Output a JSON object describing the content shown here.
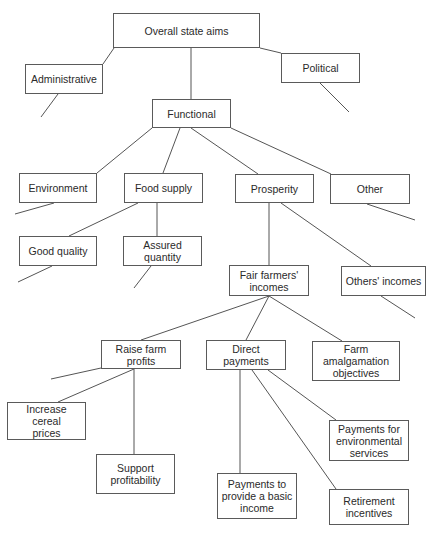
{
  "diagram": {
    "type": "tree",
    "colors": {
      "stroke": "#555555",
      "text": "#2a2a2a",
      "background": "#ffffff"
    },
    "nodes": [
      {
        "id": "overall",
        "label": "Overall state aims",
        "x": 113,
        "y": 13,
        "w": 147,
        "h": 35
      },
      {
        "id": "administrative",
        "label": "Administrative",
        "x": 25,
        "y": 64,
        "w": 78,
        "h": 30
      },
      {
        "id": "political",
        "label": "Political",
        "x": 281,
        "y": 53,
        "w": 79,
        "h": 30
      },
      {
        "id": "functional",
        "label": "Functional",
        "x": 152,
        "y": 99,
        "w": 79,
        "h": 29
      },
      {
        "id": "environment",
        "label": "Environment",
        "x": 19,
        "y": 173,
        "w": 78,
        "h": 30
      },
      {
        "id": "food-supply",
        "label": "Food supply",
        "x": 124,
        "y": 173,
        "w": 79,
        "h": 30
      },
      {
        "id": "prosperity",
        "label": "Prosperity",
        "x": 235,
        "y": 174,
        "w": 79,
        "h": 29
      },
      {
        "id": "other",
        "label": "Other",
        "x": 330,
        "y": 174,
        "w": 80,
        "h": 30
      },
      {
        "id": "good-quality",
        "label": "Good quality",
        "x": 19,
        "y": 236,
        "w": 78,
        "h": 30
      },
      {
        "id": "assured-quantity",
        "label": "Assured quantity",
        "x": 123,
        "y": 236,
        "w": 79,
        "h": 30
      },
      {
        "id": "fair-farmers-incomes",
        "label": "Fair farmers'\nincomes",
        "x": 229,
        "y": 265,
        "w": 80,
        "h": 31
      },
      {
        "id": "others-incomes",
        "label": "Others' incomes",
        "x": 341,
        "y": 266,
        "w": 85,
        "h": 30
      },
      {
        "id": "raise-farm-profits",
        "label": "Raise farm profits",
        "x": 101,
        "y": 340,
        "w": 80,
        "h": 29
      },
      {
        "id": "direct-payments",
        "label": "Direct payments",
        "x": 206,
        "y": 340,
        "w": 80,
        "h": 30
      },
      {
        "id": "farm-amalgamation",
        "label": "Farm amalgamation\nobjectives",
        "x": 312,
        "y": 341,
        "w": 88,
        "h": 40
      },
      {
        "id": "increase-cereal-prices",
        "label": "Increase cereal\nprices",
        "x": 7,
        "y": 402,
        "w": 79,
        "h": 38
      },
      {
        "id": "support-profitability",
        "label": "Support\nprofitability",
        "x": 96,
        "y": 454,
        "w": 79,
        "h": 40
      },
      {
        "id": "payments-env-services",
        "label": "Payments for\nenvironmental\nservices",
        "x": 329,
        "y": 420,
        "w": 80,
        "h": 41
      },
      {
        "id": "payments-basic-income",
        "label": "Payments to\nprovide a basic\nincome",
        "x": 217,
        "y": 473,
        "w": 80,
        "h": 46
      },
      {
        "id": "retirement-incentives",
        "label": "Retirement\nincentives",
        "x": 329,
        "y": 489,
        "w": 80,
        "h": 36
      }
    ],
    "edges": [
      {
        "from": "overall",
        "to": "administrative",
        "x1": 114,
        "y1": 48,
        "x2": 103,
        "y2": 64
      },
      {
        "from": "overall",
        "to": "political",
        "x1": 260,
        "y1": 48,
        "x2": 281,
        "y2": 53
      },
      {
        "from": "overall",
        "to": "functional",
        "x1": 191,
        "y1": 48,
        "x2": 191,
        "y2": 99
      },
      {
        "from": "administrative",
        "to": null,
        "x1": 58,
        "y1": 94,
        "x2": 41,
        "y2": 117
      },
      {
        "from": "political",
        "to": null,
        "x1": 320,
        "y1": 83,
        "x2": 349,
        "y2": 112
      },
      {
        "from": "functional",
        "to": "environment",
        "x1": 152,
        "y1": 128,
        "x2": 97,
        "y2": 173
      },
      {
        "from": "functional",
        "to": "food-supply",
        "x1": 180,
        "y1": 128,
        "x2": 163,
        "y2": 173
      },
      {
        "from": "functional",
        "to": "prosperity",
        "x1": 191,
        "y1": 128,
        "x2": 258,
        "y2": 174
      },
      {
        "from": "functional",
        "to": "other",
        "x1": 231,
        "y1": 128,
        "x2": 331,
        "y2": 174
      },
      {
        "from": "environment",
        "to": null,
        "x1": 54,
        "y1": 203,
        "x2": 15,
        "y2": 214
      },
      {
        "from": "food-supply",
        "to": "good-quality",
        "x1": 138,
        "y1": 203,
        "x2": 69,
        "y2": 236
      },
      {
        "from": "food-supply",
        "to": "assured-quantity",
        "x1": 157,
        "y1": 203,
        "x2": 157,
        "y2": 236
      },
      {
        "from": "other",
        "to": null,
        "x1": 367,
        "y1": 204,
        "x2": 415,
        "y2": 220
      },
      {
        "from": "prosperity",
        "to": "fair-farmers-incomes",
        "x1": 269,
        "y1": 203,
        "x2": 269,
        "y2": 265
      },
      {
        "from": "prosperity",
        "to": "others-incomes",
        "x1": 281,
        "y1": 203,
        "x2": 371,
        "y2": 266
      },
      {
        "from": "good-quality",
        "to": null,
        "x1": 52,
        "y1": 266,
        "x2": 18,
        "y2": 282
      },
      {
        "from": "assured-quantity",
        "to": null,
        "x1": 151,
        "y1": 266,
        "x2": 134,
        "y2": 288
      },
      {
        "from": "others-incomes",
        "to": null,
        "x1": 381,
        "y1": 296,
        "x2": 415,
        "y2": 318
      },
      {
        "from": "fair-farmers-incomes",
        "to": "raise-farm-profits",
        "x1": 269,
        "y1": 296,
        "x2": 141,
        "y2": 340
      },
      {
        "from": "fair-farmers-incomes",
        "to": "direct-payments",
        "x1": 269,
        "y1": 296,
        "x2": 246,
        "y2": 340
      },
      {
        "from": "fair-farmers-incomes",
        "to": "farm-amalgamation",
        "x1": 269,
        "y1": 296,
        "x2": 342,
        "y2": 341
      },
      {
        "from": "raise-farm-profits",
        "to": null,
        "x1": 101,
        "y1": 368,
        "x2": 51,
        "y2": 379
      },
      {
        "from": "raise-farm-profits",
        "to": "increase-cereal-prices",
        "x1": 134,
        "y1": 369,
        "x2": 58,
        "y2": 402
      },
      {
        "from": "raise-farm-profits",
        "to": "support-profitability",
        "x1": 134,
        "y1": 369,
        "x2": 134,
        "y2": 454
      },
      {
        "from": "direct-payments",
        "to": "payments-basic-income",
        "x1": 240,
        "y1": 370,
        "x2": 240,
        "y2": 473
      },
      {
        "from": "direct-payments",
        "to": "retirement-incentives",
        "x1": 252,
        "y1": 370,
        "x2": 336,
        "y2": 489
      },
      {
        "from": "direct-payments",
        "to": "payments-env-services",
        "x1": 268,
        "y1": 370,
        "x2": 336,
        "y2": 420
      }
    ]
  }
}
